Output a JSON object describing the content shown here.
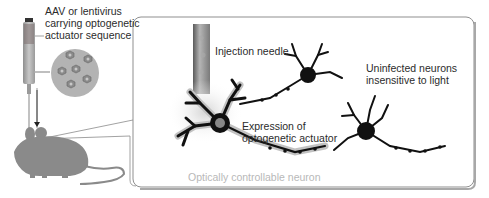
{
  "diagram": {
    "type": "optogenetics-schematic",
    "labels": {
      "vector_line1": "AAV or lentivirus",
      "vector_line2": "carrying optogenetic",
      "vector_line3": "actuator sequence",
      "needle": "Injection needle",
      "uninfected_line1": "Uninfected neurons",
      "uninfected_line2": "insensitive to light",
      "expression_line1": "Expression of",
      "expression_line2": "optogenetic actuator",
      "controllable": "Optically controllable neuron"
    },
    "colors": {
      "mouse": "#8a8a8a",
      "neuron": "#111111",
      "panel_border": "#9a9a9a",
      "halo": "#bdbdbd",
      "syringe": "#9e9e9e",
      "virus_circle": "#b0b0b0",
      "caption_light": "#b8b8b8"
    },
    "nodes": [
      {
        "id": "syringe",
        "label": "AAV or lentivirus carrying optogenetic actuator sequence"
      },
      {
        "id": "mouse",
        "label": "Mouse (injection target)"
      },
      {
        "id": "panel",
        "label": "Zoomed brain region"
      },
      {
        "id": "needle",
        "label": "Injection needle"
      },
      {
        "id": "infected-neuron",
        "label": "Optically controllable neuron"
      },
      {
        "id": "uninfected-neurons",
        "label": "Uninfected neurons insensitive to light"
      }
    ],
    "edges": [
      {
        "from": "syringe",
        "to": "mouse",
        "type": "arrow"
      },
      {
        "from": "mouse",
        "to": "panel",
        "type": "zoom-callout"
      }
    ]
  }
}
